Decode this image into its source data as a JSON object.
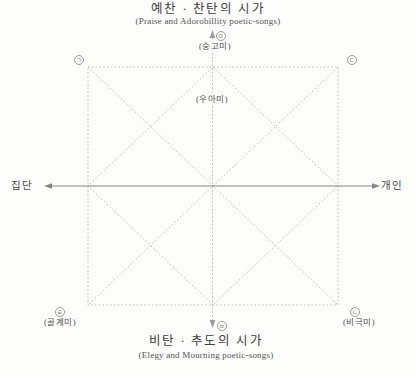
{
  "header": {
    "title_ko": "예찬 · 찬탄의 시가",
    "title_en": "(Praise and Adorobillity poetic-songs)"
  },
  "footer": {
    "title_ko": "비탄 · 추도의 시가",
    "title_en": "(Elegy and Mourning poetic-songs)"
  },
  "axis_labels": {
    "left": "집단",
    "right": "개인"
  },
  "category_labels": {
    "top": "(숭고미)",
    "center": "(우아미)",
    "bottom_left": "(골계미)",
    "bottom_right": "(비극미)"
  },
  "markers": {
    "top_left": "ㄱ",
    "top_right": "ㄷ",
    "top_center": "ㅁ",
    "bottom_left": "ㄹ",
    "bottom_right": "ㄴ",
    "bottom_center": "ㅂ"
  },
  "colors": {
    "dotted": "#b6b6b6",
    "axis": "#858585",
    "ink": "#4a4a4a",
    "paper": "#fdfdfc"
  }
}
